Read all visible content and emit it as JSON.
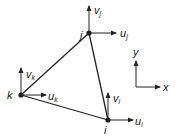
{
  "diagram": {
    "colors": {
      "line": "#222222",
      "text": "#222222",
      "background": "#ffffff"
    },
    "nodes": [
      {
        "id": "i",
        "label": "i",
        "x": 108,
        "y": 120
      },
      {
        "id": "j",
        "label": "j",
        "x": 89,
        "y": 33
      },
      {
        "id": "k",
        "label": "k",
        "x": 21,
        "y": 95
      }
    ],
    "edges": [
      [
        "i",
        "j"
      ],
      [
        "j",
        "k"
      ],
      [
        "k",
        "i"
      ]
    ],
    "dof_labels": {
      "v_j": {
        "base": "v",
        "sub": "j"
      },
      "u_j": {
        "base": "u",
        "sub": "j"
      },
      "v_k": {
        "base": "v",
        "sub": "k"
      },
      "u_k": {
        "base": "u",
        "sub": "k"
      },
      "v_i": {
        "base": "v",
        "sub": "i"
      },
      "u_i": {
        "base": "u",
        "sub": "i"
      }
    },
    "axes": {
      "x_label": "x",
      "y_label": "y"
    }
  }
}
